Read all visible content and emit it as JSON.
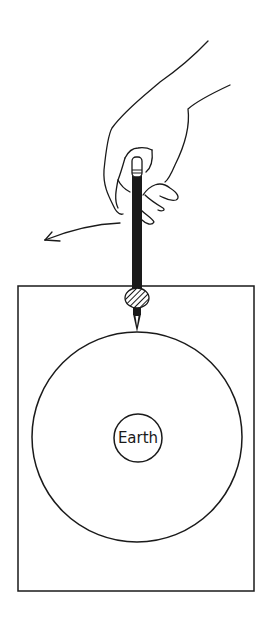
{
  "diagram": {
    "center_label": "Earth",
    "colors": {
      "ink": "#1a1a1a",
      "background": "#ffffff"
    },
    "elements": {
      "hand": "hand-holding-pencil",
      "pencil": "pencil",
      "pivot": "hatched-pivot-knob",
      "arrow": "counterclockwise-motion-arrow",
      "paper": "rectangular-sheet",
      "orbit": "large-circle-orbit",
      "earth": "small-circle-earth"
    }
  }
}
